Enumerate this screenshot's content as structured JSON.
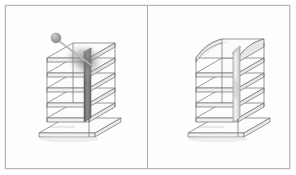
{
  "figure": {
    "panel_count": 2,
    "background_color": "#ffffff",
    "frame_border_color": "#b9b9b9",
    "divider_color": "#a9a9a9",
    "line_color": "#6e6e6e",
    "slab_fill_color": "#fbfbfb",
    "slab_edge_color": "#777777"
  },
  "panels": [
    {
      "id": "panel-left",
      "name": "impact-state-view",
      "caption": "",
      "structure": {
        "name": "multi-story-frame",
        "story_count": 5,
        "has_ground_slab": true,
        "core_wall": {
          "name": "shear-wall-core",
          "shade": "#6b6b6b",
          "state": "impacted"
        }
      },
      "impactor": {
        "name": "pendulum-impactor",
        "visible": true,
        "ball_color": "#9a9a9a",
        "rod_color": "#b4b4b4",
        "ball_center_x": 51,
        "ball_center_y": 33,
        "ball_radius": 5,
        "rod_end_x": 86,
        "rod_end_y": 60
      },
      "impact_blur": {
        "name": "impact-blur-zone",
        "visible": true,
        "center_x": 82,
        "center_y": 57,
        "radius": 17,
        "color": "#8e8e8e"
      }
    },
    {
      "id": "panel-right",
      "name": "deformed-state-view",
      "caption": "",
      "structure": {
        "name": "multi-story-frame",
        "story_count": 5,
        "has_ground_slab": true,
        "core_wall": {
          "name": "shear-wall-core",
          "shade": "#c6c6c6",
          "state": "deformed"
        },
        "roof_deformation": {
          "name": "deformed-roof-slab",
          "visible": true,
          "description": "bulged displaced top slab"
        }
      },
      "impactor": {
        "name": "pendulum-impactor",
        "visible": false,
        "ball_color": "#9a9a9a",
        "rod_color": "#b4b4b4",
        "ball_center_x": 0,
        "ball_center_y": 0,
        "ball_radius": 0,
        "rod_end_x": 0,
        "rod_end_y": 0
      },
      "impact_blur": {
        "name": "impact-blur-zone",
        "visible": false,
        "center_x": 0,
        "center_y": 0,
        "radius": 0,
        "color": "#8e8e8e"
      }
    }
  ]
}
